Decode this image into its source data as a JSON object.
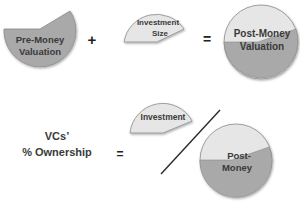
{
  "colors": {
    "dark_slice": "#a9a9a9",
    "light_slice": "#e6e6e6",
    "outline": "#8c8c8c",
    "text": "#3a3a3a",
    "divider_line": "#2a2a2a"
  },
  "equation1": {
    "pre_money": {
      "line1": "Pre-Money",
      "line2": "Valuation"
    },
    "plus": "+",
    "investment": {
      "line1": "Investment",
      "line2": "Size"
    },
    "equals": "=",
    "post_money": {
      "line1": "Post-Money",
      "line2": "Valuation"
    }
  },
  "equation2": {
    "result": {
      "line1": "VCs’",
      "line2": "% Ownership"
    },
    "equals": "=",
    "numerator": {
      "label": "Investment"
    },
    "denominator": {
      "line1": "Post-",
      "line2": "Money"
    }
  }
}
